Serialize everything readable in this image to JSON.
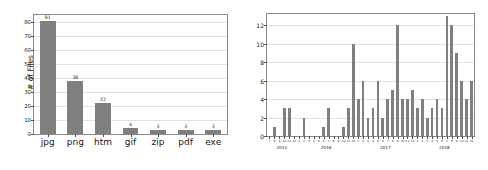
{
  "chart_data": [
    {
      "type": "bar",
      "id": "file-type-counts",
      "title": "",
      "xlabel": "",
      "ylabel": "# of Files",
      "categories": [
        "jpg",
        "png",
        "htm",
        "gif",
        "zip",
        "pdf",
        "exe"
      ],
      "values": [
        81,
        38,
        22,
        4,
        3,
        3,
        3
      ],
      "value_labels": [
        "81",
        "38",
        "22",
        "4",
        "3",
        "3",
        "3"
      ],
      "ylim": [
        0,
        85
      ],
      "yticks": [
        0,
        10,
        20,
        30,
        40,
        50,
        60,
        70,
        80
      ],
      "ytick_labels": [
        "0",
        "10",
        "20",
        "30",
        "40",
        "50",
        "60",
        "70",
        "80"
      ],
      "grid": true,
      "bar_color": "#808080",
      "legend": null
    },
    {
      "type": "bar",
      "id": "monthly-transactions",
      "title": "",
      "xlabel": "",
      "ylabel": "# of Txs",
      "ylim": [
        0,
        13.2
      ],
      "yticks": [
        0,
        2,
        4,
        6,
        8,
        10,
        12
      ],
      "ytick_labels": [
        "0",
        "2",
        "4",
        "6",
        "8",
        "10",
        "12"
      ],
      "grid": true,
      "bar_color": "#808080",
      "legend": null,
      "year_groups": [
        {
          "label": "2015",
          "start_index": 0,
          "end_index": 5
        },
        {
          "label": "2016",
          "start_index": 6,
          "end_index": 17
        },
        {
          "label": "2017",
          "start_index": 18,
          "end_index": 29
        },
        {
          "label": "2018",
          "start_index": 30,
          "end_index": 41
        }
      ],
      "categories": [
        "7",
        "8",
        "9",
        "10",
        "11",
        "12",
        "1",
        "2",
        "3",
        "4",
        "5",
        "6",
        "7",
        "8",
        "9",
        "10",
        "11",
        "12",
        "1",
        "2",
        "3",
        "4",
        "5",
        "6",
        "7",
        "8",
        "9",
        "10",
        "11",
        "12",
        "1",
        "2",
        "3",
        "4",
        "5",
        "6",
        "7",
        "8",
        "9",
        "10",
        "11",
        "12"
      ],
      "values": [
        0,
        1,
        0,
        3,
        3,
        0,
        0,
        2,
        0,
        0,
        0,
        1,
        3,
        0,
        0,
        1,
        3,
        10,
        4,
        6,
        2,
        3,
        6,
        2,
        4,
        5,
        12,
        4,
        4,
        5,
        3,
        4,
        2,
        3,
        4,
        3,
        13,
        12,
        9,
        6,
        4,
        6,
        1,
        0,
        3,
        1
      ],
      "values_note": "bar heights read from gridlines, # of Txs per month"
    }
  ],
  "figures": {
    "left": {
      "name": "file-type-bar-chart"
    },
    "right": {
      "name": "monthly-transaction-bar-chart"
    }
  }
}
